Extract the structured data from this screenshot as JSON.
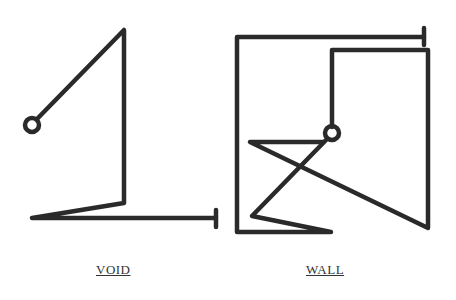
{
  "figures": [
    {
      "name": "void",
      "label": "VOID"
    },
    {
      "name": "wall",
      "label": "WALL"
    }
  ],
  "colors": {
    "stroke": "#2a2a2a",
    "background": "#ffffff"
  }
}
